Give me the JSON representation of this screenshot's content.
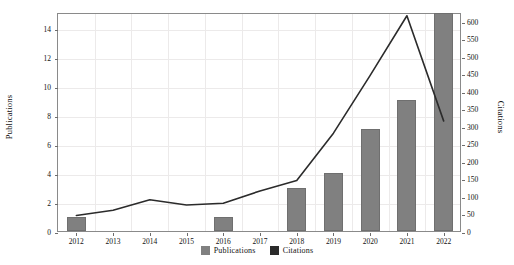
{
  "chart_data": {
    "type": "bar",
    "title": "",
    "xlabel": "",
    "ylabel": "Publications",
    "y2label": "Citations",
    "categories": [
      "2012",
      "2013",
      "2014",
      "2015",
      "2016",
      "2017",
      "2018",
      "2019",
      "2020",
      "2021",
      "2022"
    ],
    "series": [
      {
        "name": "Publications",
        "type": "bar",
        "axis": "left",
        "color": "#808080",
        "values": [
          1,
          0,
          0,
          0,
          1,
          0,
          3,
          4,
          7,
          9,
          15
        ]
      },
      {
        "name": "Citations",
        "type": "line",
        "axis": "right",
        "color": "#2b2b2b",
        "values": [
          50,
          65,
          95,
          80,
          85,
          120,
          150,
          285,
          450,
          620,
          320
        ]
      }
    ],
    "ylim": [
      0,
      15.1
    ],
    "y2lim": [
      0,
      625
    ],
    "yticks": [
      0,
      2,
      4,
      6,
      8,
      10,
      12,
      14
    ],
    "y2ticks": [
      0,
      50,
      100,
      150,
      200,
      250,
      300,
      350,
      400,
      450,
      500,
      550,
      600
    ],
    "grid": true,
    "legend_position": "bottom-center"
  },
  "legend": {
    "items": [
      {
        "label": "Publications",
        "color": "#808080"
      },
      {
        "label": "Citations",
        "color": "#2b2b2b"
      }
    ]
  }
}
